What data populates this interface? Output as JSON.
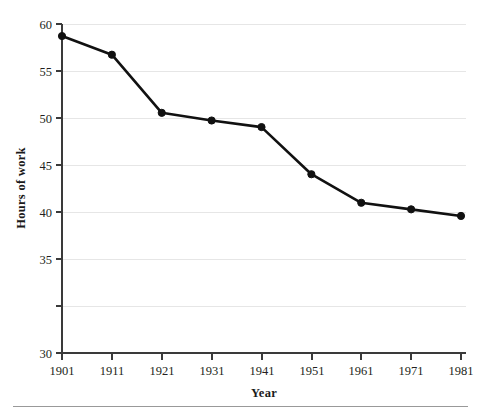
{
  "chart_data": {
    "type": "line",
    "title": "",
    "xlabel": "Year",
    "ylabel": "Hours of  work",
    "categories": [
      "1901",
      "1911",
      "1921",
      "1931",
      "1941",
      "1951",
      "1961",
      "1971",
      "1981"
    ],
    "x": [
      1901,
      1911,
      1921,
      1931,
      1941,
      1951,
      1961,
      1971,
      1981
    ],
    "values": [
      58.9,
      57.2,
      51.9,
      51.2,
      50.6,
      46.3,
      43.7,
      43.1,
      42.5
    ],
    "series": [
      {
        "name": "Hours of work",
        "values": [
          58.9,
          57.2,
          51.9,
          51.2,
          50.6,
          46.3,
          43.7,
          43.1,
          42.5
        ]
      }
    ],
    "ylim": [
      30,
      60
    ],
    "xlim": [
      1901,
      1981
    ],
    "yticks": [
      30,
      35,
      40,
      45,
      50,
      55,
      60
    ],
    "ytick_labels": [
      "30",
      "35",
      "40",
      "45",
      "50",
      "55",
      "60"
    ],
    "xticks": [
      1901,
      1911,
      1921,
      1931,
      1941,
      1951,
      1961,
      1971,
      1981
    ],
    "xtick_labels": [
      "1901",
      "1911",
      "1921",
      "1931",
      "1941",
      "1951",
      "1961",
      "1971",
      "1981"
    ],
    "grid": true,
    "grid_axis": "y",
    "legend": false,
    "legend_position": "none",
    "marker": "circle",
    "line_color": "#111111",
    "marker_color": "#111111",
    "grid_color": "#e6e6e6",
    "axis_color": "#3a3a3a",
    "background_color": "#ffffff"
  },
  "labels": {
    "y_axis_title": "Hours of  work",
    "x_axis_title": "Year",
    "y_ticks": [
      "60",
      "55",
      "50",
      "45",
      "40",
      "35",
      "30"
    ],
    "x_ticks": [
      "1901",
      "1911",
      "1921",
      "1931",
      "1941",
      "1951",
      "1961",
      "1971",
      "1981"
    ]
  }
}
